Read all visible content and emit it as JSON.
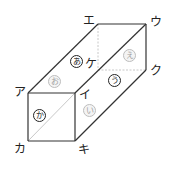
{
  "figure": {
    "type": "rectangular-prism",
    "vertices": {
      "a": {
        "label": "ア",
        "x": 28,
        "y": 93
      },
      "i": {
        "label": "イ",
        "x": 75,
        "y": 93
      },
      "u": {
        "label": "ウ",
        "x": 146,
        "y": 24
      },
      "e": {
        "label": "エ",
        "x": 98,
        "y": 24
      },
      "ka": {
        "label": "カ",
        "x": 28,
        "y": 141
      },
      "ki": {
        "label": "キ",
        "x": 75,
        "y": 141
      },
      "ku": {
        "label": "ク",
        "x": 146,
        "y": 70
      },
      "ke": {
        "label": "ケ",
        "x": 98,
        "y": 70
      }
    },
    "face_labels": {
      "a_face": {
        "label": "あ",
        "style": "dark"
      },
      "i_face": {
        "label": "い",
        "style": "light"
      },
      "u_face": {
        "label": "う",
        "style": "dark"
      },
      "e_face": {
        "label": "え",
        "style": "light"
      },
      "o_face": {
        "label": "お",
        "style": "light"
      },
      "ka_face": {
        "label": "か",
        "style": "dark"
      }
    },
    "colors": {
      "edge": "#333333",
      "hidden_edge": "#c8c8c8",
      "diagonal": "#c8c8c8"
    }
  }
}
